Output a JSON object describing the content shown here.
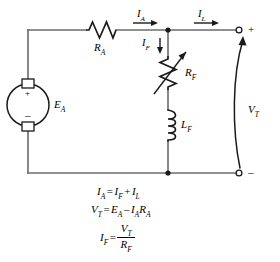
{
  "diagram": {
    "type": "electrical-schematic",
    "colors": {
      "wire": "#4d4d4d",
      "component": "#1a1a1a",
      "text": "#000000",
      "background": "#ffffff"
    }
  },
  "components": {
    "source": {
      "name": "armature-voltage-source",
      "label": "E",
      "label_sub": "A",
      "plus": "+",
      "minus": "–",
      "symbol": "dc-machine-circle-with-brushes"
    },
    "armature_resistor": {
      "name": "armature-resistance",
      "label": "R",
      "label_sub": "A",
      "symbol": "zigzag-resistor"
    },
    "field_resistor": {
      "name": "field-resistance",
      "label": "R",
      "label_sub": "F",
      "symbol": "variable-resistor-rheostat"
    },
    "field_inductor": {
      "name": "field-inductance",
      "label": "L",
      "label_sub": "F",
      "symbol": "coil-inductor"
    }
  },
  "currents": {
    "armature": {
      "label": "I",
      "label_sub": "A",
      "direction": "right"
    },
    "load": {
      "label": "I",
      "label_sub": "L",
      "direction": "right"
    },
    "field": {
      "label": "I",
      "label_sub": "F",
      "direction": "down"
    }
  },
  "terminals": {
    "positive": {
      "sign": "+",
      "name": "positive-terminal"
    },
    "negative": {
      "sign": "–",
      "name": "negative-terminal"
    },
    "voltage": {
      "label": "V",
      "label_sub": "T",
      "name": "terminal-voltage"
    }
  },
  "equations": [
    {
      "id": "current-sum",
      "lhs": "I",
      "lhs_sub": "A",
      "parts": [
        {
          "var": "I",
          "sub": "F"
        },
        {
          "op": "+"
        },
        {
          "var": "I",
          "sub": "L"
        }
      ]
    },
    {
      "id": "terminal-voltage",
      "lhs": "V",
      "lhs_sub": "T",
      "parts": [
        {
          "var": "E",
          "sub": "A"
        },
        {
          "op": "–"
        },
        {
          "var": "I",
          "sub": "A"
        },
        {
          "var": "R",
          "sub": "A"
        }
      ]
    },
    {
      "id": "field-current",
      "lhs": "I",
      "lhs_sub": "F",
      "fraction": {
        "numerator": {
          "var": "V",
          "sub": "T"
        },
        "denominator": {
          "var": "R",
          "sub": "F"
        }
      }
    }
  ]
}
